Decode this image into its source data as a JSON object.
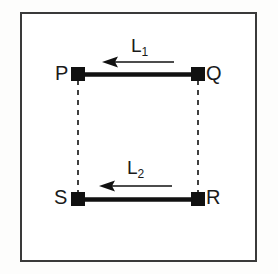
{
  "diagram": {
    "background_color": "#ffffff",
    "frame_color": "#3a3a3a",
    "line_color": "#111111",
    "vertices": [
      {
        "id": "P",
        "label": "P",
        "x": 78,
        "y": 74,
        "corner": "top-left"
      },
      {
        "id": "Q",
        "label": "Q",
        "x": 198,
        "y": 74,
        "corner": "top-right"
      },
      {
        "id": "S",
        "label": "S",
        "x": 78,
        "y": 199,
        "corner": "bottom-left"
      },
      {
        "id": "R",
        "label": "R",
        "x": 198,
        "y": 199,
        "corner": "bottom-right"
      }
    ],
    "solid_bars": [
      {
        "name": "bar-PQ",
        "from": "P",
        "to": "Q",
        "x1": 78,
        "y1": 74,
        "x2": 198,
        "y2": 74
      },
      {
        "name": "bar-SR",
        "from": "S",
        "to": "R",
        "x1": 78,
        "y1": 199,
        "x2": 198,
        "y2": 199
      }
    ],
    "dashed_connectors": [
      {
        "name": "dashed-PS",
        "from": "P",
        "to": "S",
        "x1": 78,
        "y1": 80,
        "x2": 78,
        "y2": 194
      },
      {
        "name": "dashed-QR",
        "from": "Q",
        "to": "R",
        "x1": 198,
        "y1": 80,
        "x2": 198,
        "y2": 194
      }
    ],
    "arrows": [
      {
        "name": "arrow-L1",
        "label": "L",
        "subscript": "1",
        "direction": "left",
        "tail_x": 174,
        "tip_x": 104,
        "y": 62
      },
      {
        "name": "arrow-L2",
        "label": "L",
        "subscript": "2",
        "direction": "left",
        "tail_x": 172,
        "tip_x": 101,
        "y": 186
      }
    ]
  }
}
